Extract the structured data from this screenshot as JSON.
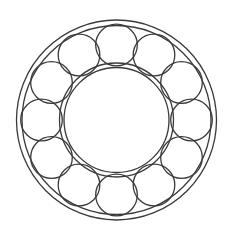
{
  "document": {
    "kind": "technical-line-drawing",
    "subject": "ball-bearing",
    "view": "front-face-cross-section",
    "canvas_width": 235,
    "canvas_height": 242,
    "background_color": "#ffffff",
    "stroke_color": "#3a3a3a",
    "stroke_width": 1.3,
    "fill": "none",
    "has_text_labels": false,
    "has_dimensions": false,
    "title": ""
  },
  "geometry": {
    "center": {
      "x": 116.5,
      "y": 120.0
    },
    "outer_race": {
      "name": "outer-ring",
      "outer_radius": 100.0,
      "inner_radius": 94.5,
      "circle_count": 2
    },
    "inner_race": {
      "name": "inner-ring",
      "outer_radius": 57.0,
      "inner_radius": 52.5,
      "circle_count": 2
    },
    "balls": {
      "name": "rolling-elements",
      "count": 12,
      "radius": 20.8,
      "pitch_circle_radius": 75.0,
      "start_angle_deg": -90,
      "angular_pitch_deg": 30,
      "centers": [
        {
          "index": 1,
          "angle_deg": -90,
          "x": 116.5,
          "y": 45.0
        },
        {
          "index": 2,
          "angle_deg": -60,
          "x": 154.0,
          "y": 55.0
        },
        {
          "index": 3,
          "angle_deg": -30,
          "x": 181.5,
          "y": 82.5
        },
        {
          "index": 4,
          "angle_deg": 0,
          "x": 191.5,
          "y": 120.0
        },
        {
          "index": 5,
          "angle_deg": 30,
          "x": 181.5,
          "y": 157.5
        },
        {
          "index": 6,
          "angle_deg": 60,
          "x": 154.0,
          "y": 185.0
        },
        {
          "index": 7,
          "angle_deg": 90,
          "x": 116.5,
          "y": 195.0
        },
        {
          "index": 8,
          "angle_deg": 120,
          "x": 79.0,
          "y": 185.0
        },
        {
          "index": 9,
          "angle_deg": 150,
          "x": 51.5,
          "y": 157.5
        },
        {
          "index": 10,
          "angle_deg": 180,
          "x": 41.5,
          "y": 120.0
        },
        {
          "index": 11,
          "angle_deg": 210,
          "x": 51.5,
          "y": 82.5
        },
        {
          "index": 12,
          "angle_deg": 240,
          "x": 79.0,
          "y": 55.0
        }
      ]
    }
  }
}
